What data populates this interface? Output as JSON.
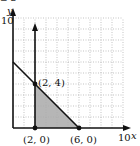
{
  "header_fragment": "≥ 2",
  "chart_data": {
    "type": "area",
    "title": "",
    "xlabel": "x",
    "ylabel": "y",
    "xlim": [
      0,
      10
    ],
    "ylim": [
      0,
      10
    ],
    "grid": true,
    "x_tick_labels": [
      "10"
    ],
    "y_tick_labels": [
      "10"
    ],
    "boundary_lines": [
      {
        "equation": "x + y = 6",
        "from": [
          0,
          6
        ],
        "to": [
          6,
          0
        ]
      },
      {
        "equation": "x = 2",
        "from": [
          2,
          0
        ],
        "to": [
          2,
          10
        ],
        "arrow": "up"
      },
      {
        "equation": "y = 0",
        "from": [
          0,
          0
        ],
        "to": [
          10,
          0
        ],
        "arrow": "right"
      }
    ],
    "shaded_region": {
      "vertices": [
        [
          2,
          0
        ],
        [
          2,
          4
        ],
        [
          6,
          0
        ]
      ],
      "fill": "#a9a9a9"
    },
    "points": [
      {
        "x": 2,
        "y": 4,
        "label": "(2, 4)"
      },
      {
        "x": 2,
        "y": 0,
        "label": "(2, 0)"
      },
      {
        "x": 6,
        "y": 0,
        "label": "(6, 0)"
      }
    ]
  },
  "labels": {
    "y_axis": "y",
    "x_axis": "x",
    "y_max": "10",
    "x_max": "10",
    "p1": "(2, 4)",
    "p2": "(2, 0)",
    "p3": "(6, 0)"
  },
  "colors": {
    "shade": "#a9a9a9",
    "grid": "#9a9a9a",
    "ink": "#111111"
  }
}
